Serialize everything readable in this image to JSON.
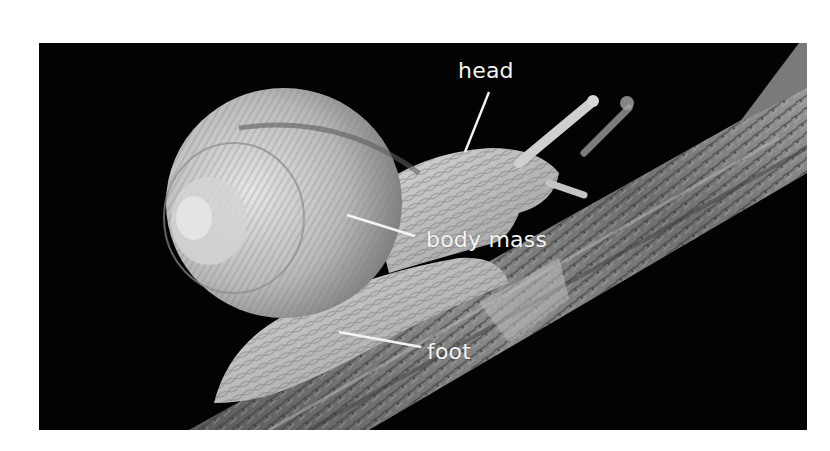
{
  "figure": {
    "background_color": "#030303",
    "label_color": "#f4f4f4",
    "labels": [
      {
        "id": "head",
        "text": "head"
      },
      {
        "id": "body_mass",
        "text": "body mass"
      },
      {
        "id": "foot",
        "text": "foot"
      }
    ]
  }
}
